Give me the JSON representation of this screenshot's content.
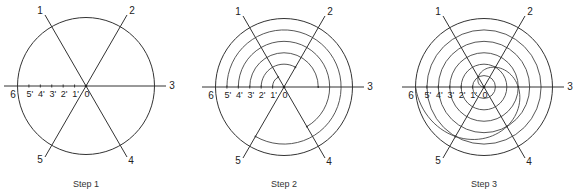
{
  "figure": {
    "steps": [
      {
        "caption": "Step 1",
        "stage": "circle-and-rays"
      },
      {
        "caption": "Step 2",
        "stage": "concentric-arcs"
      },
      {
        "caption": "Step 3",
        "stage": "spiral-curve"
      }
    ],
    "ray_labels": [
      "1",
      "2",
      "3",
      "4",
      "5",
      "6"
    ],
    "scale_labels": [
      "6",
      "5'",
      "4'",
      "3'",
      "2'",
      "1'",
      "0"
    ],
    "divisions": 6,
    "line_color": "#333333"
  }
}
